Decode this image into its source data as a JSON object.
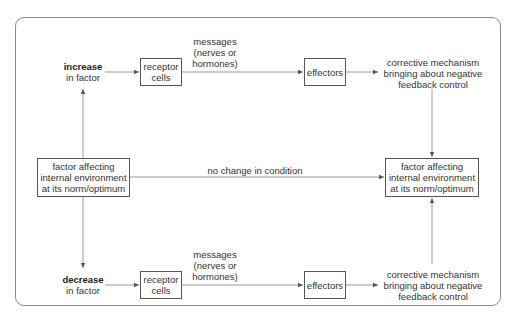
{
  "diagram": {
    "top_branch": {
      "stimulus_bold": "increase",
      "stimulus_rest": "in factor",
      "receptor": [
        "receptor",
        "cells"
      ],
      "messages": [
        "messages",
        "(nerves or",
        "hormones)"
      ],
      "effectors": "effectors",
      "corrective": [
        "corrective mechanism",
        "bringing about negative",
        "feedback control"
      ]
    },
    "middle": {
      "left_box": [
        "factor affecting",
        "internal environment",
        "at its norm/optimum"
      ],
      "no_change": "no change in condition",
      "right_box": [
        "factor affecting",
        "internal environment",
        "at its norm/optimum"
      ]
    },
    "bottom_branch": {
      "stimulus_bold": "decrease",
      "stimulus_rest": "in factor",
      "receptor": [
        "receptor",
        "cells"
      ],
      "messages": [
        "messages",
        "(nerves or",
        "hormones)"
      ],
      "effectors": "effectors",
      "corrective": [
        "corrective mechanism",
        "bringing about negative",
        "feedback control"
      ]
    },
    "colors": {
      "line": "#8a8a8a",
      "box_border": "#555555",
      "text": "#333333"
    }
  }
}
